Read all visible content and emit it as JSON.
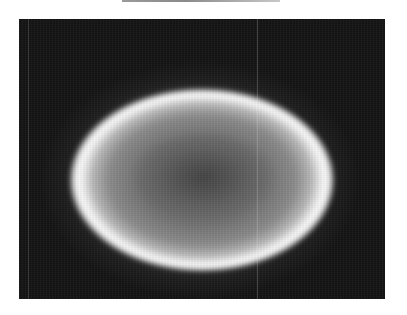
{
  "image": {
    "description": "Grayscale photograph of a glowing elliptical ring on a dark background",
    "colors": {
      "background": "#ffffff",
      "frame": "#141414",
      "ring_peak": "#ffffff",
      "interior": "#6e6e6e",
      "interior_center": "#5c5c5c"
    },
    "ring": {
      "center_x": 200,
      "center_y": 180,
      "radius_x": 121,
      "radius_y": 83
    }
  }
}
